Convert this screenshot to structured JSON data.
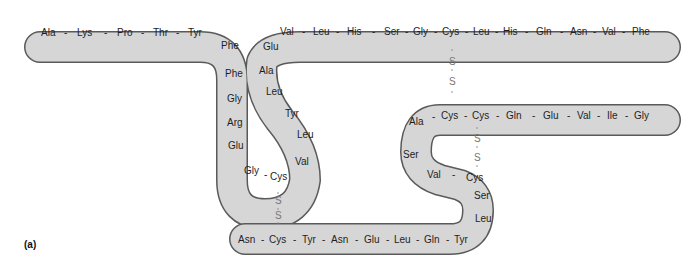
{
  "figure_label": "(a)",
  "colors": {
    "tube_fill": "#d6d6d6",
    "tube_outline": "#5a5a5a",
    "text": "#1e1e1e",
    "disulfide": "#777777"
  },
  "chains": {
    "chain_1": {
      "description": "Left chain: top-left horizontal then S-loop down",
      "residues": [
        "Ala",
        "Lys",
        "Pro",
        "Thr",
        "Tyr",
        "Phe",
        "Phe",
        "Gly",
        "Arg",
        "Glu",
        "Gly",
        "Cys",
        "Val",
        "Leu",
        "Tyr",
        "Leu",
        "Ala",
        "Glu",
        "Val",
        "Leu",
        "His",
        "Ser",
        "Gly",
        "Cys",
        "Leu",
        "His",
        "Gln",
        "Asn",
        "Val",
        "Phe"
      ]
    },
    "chain_2": {
      "description": "Right chain: lower horizontal then S-loop up",
      "residues": [
        "Asn",
        "Cys",
        "Tyr",
        "Asn",
        "Glu",
        "Leu",
        "Gln",
        "Tyr",
        "Leu",
        "Ser",
        "Cys",
        "Val",
        "Ser",
        "Ala",
        "Cys",
        "Cys",
        "Gln",
        "Glu",
        "Val",
        "Ile",
        "Gly"
      ]
    }
  },
  "labels": {
    "top_left_row": [
      "Ala",
      "Lys",
      "Pro",
      "Thr",
      "Tyr"
    ],
    "left_down": [
      "Phe",
      "Phe",
      "Gly",
      "Arg",
      "Glu"
    ],
    "left_bottom": [
      "Gly",
      "Cys"
    ],
    "mid_up": [
      "Val",
      "Leu",
      "Tyr",
      "Leu",
      "Ala",
      "Glu"
    ],
    "top_right_row": [
      "Val",
      "Leu",
      "His",
      "Ser",
      "Gly",
      "Cys",
      "Leu",
      "His",
      "Gln",
      "Asn",
      "Val",
      "Phe"
    ],
    "bottom_row": [
      "Asn",
      "Cys",
      "Tyr",
      "Asn",
      "Glu",
      "Leu",
      "Gln",
      "Tyr"
    ],
    "right_up": [
      "Leu",
      "Ser",
      "Cys",
      "Val"
    ],
    "right_mid": [
      "Ser",
      "Ala"
    ],
    "right_row": [
      "Cys",
      "Cys",
      "Gln",
      "Glu",
      "Val",
      "Ile",
      "Gly"
    ]
  },
  "disulfide_bonds": [
    {
      "label": "S-S",
      "from": "Cys (top row)",
      "to": "Cys (right row)",
      "atoms": [
        "S",
        "S"
      ]
    },
    {
      "label": "S-S",
      "from": "Cys (left loop bottom)",
      "to": "Cys (bottom row)",
      "atoms": [
        "S",
        "S"
      ]
    },
    {
      "label": "S-S",
      "from": "Cys (right row)",
      "to": "Cys (right lower loop)",
      "atoms": [
        "S",
        "S"
      ]
    }
  ],
  "separator": "-"
}
